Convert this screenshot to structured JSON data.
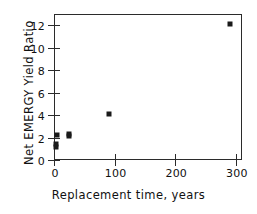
{
  "chart_data": {
    "type": "scatter",
    "title": "",
    "xlabel": "Replacement time, years",
    "ylabel": "Net EMERGY Yield Ratio",
    "xlim": [
      0,
      310
    ],
    "ylim": [
      0,
      13
    ],
    "xticks": [
      0,
      100,
      200,
      300
    ],
    "xtick_labels": [
      "0",
      "100",
      "200",
      "300"
    ],
    "yticks": [
      0,
      2,
      4,
      6,
      8,
      10,
      12
    ],
    "ytick_labels": [
      "0",
      "2",
      "4",
      "6",
      "8",
      "10",
      "12"
    ],
    "grid": false,
    "legend": null,
    "marker": "filled-square",
    "marker_color": "#1a1a1a",
    "points": [
      {
        "x": 4,
        "y": 1.2
      },
      {
        "x": 4,
        "y": 1.4
      },
      {
        "x": 5,
        "y": 2.25
      },
      {
        "x": 24,
        "y": 2.1
      },
      {
        "x": 25,
        "y": 2.35
      },
      {
        "x": 90,
        "y": 4.1
      },
      {
        "x": 290,
        "y": 12.1
      }
    ]
  },
  "axes": {
    "frame_color": "#2b2b2b"
  }
}
